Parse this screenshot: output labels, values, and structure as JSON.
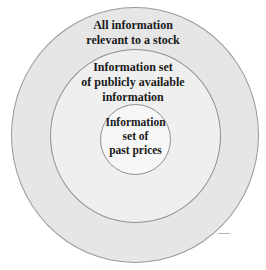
{
  "diagram": {
    "type": "concentric-circles",
    "rings": [
      {
        "id": "outer",
        "lines": [
          "All information",
          "relevant to a stock"
        ],
        "fill": "#e6e6e6"
      },
      {
        "id": "middle",
        "lines": [
          "Information set",
          "of publicly available",
          "information"
        ],
        "fill": "#efefef"
      },
      {
        "id": "inner",
        "lines": [
          "Information",
          "set of",
          "past prices"
        ],
        "fill": "#f7f7f7"
      }
    ],
    "outline_color": "#9a9a9a",
    "text_color": "#1a1a1a"
  }
}
